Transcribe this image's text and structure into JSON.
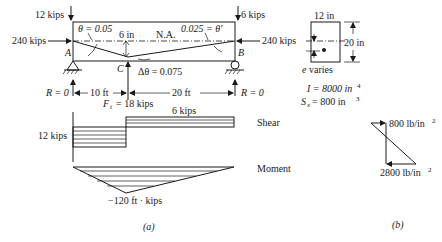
{
  "figure_a": {
    "label": "(a)",
    "beam": {
      "left_support": "A",
      "right_support": "B",
      "point_c": "C",
      "left_vertical_load": "12 kips",
      "right_vertical_load": "6 kips",
      "left_axial_load": "240 kips",
      "right_axial_load": "240 kips",
      "theta_left": "θ = 0.05",
      "theta_right": "0.025 = θ′",
      "eccentricity": "6 in",
      "neutral_axis": "N.A.",
      "delta_theta": "Δθ = 0.075",
      "reaction_left": "R = 0",
      "reaction_right": "R = 0",
      "span_left": "10 ft",
      "span_right": "20 ft",
      "tendon_force": "F",
      "tendon_force_sub": "t",
      "tendon_force_value": "= 18 kips"
    },
    "shear": {
      "title": "Shear",
      "left_value": "12 kips",
      "right_value": "6 kips"
    },
    "moment": {
      "title": "Moment",
      "min_value": "−120 ft · kips"
    }
  },
  "figure_b": {
    "label": "(b)",
    "section": {
      "width": "12 in",
      "height": "20 in",
      "e_label": "e",
      "e_text": "varies"
    },
    "I": "I = 8000 in",
    "I_exp": "4",
    "Sx": "S",
    "Sx_sub": "x",
    "Sx_value": "= 800 in",
    "Sx_exp": "3",
    "stress_top": "800 lb/in",
    "stress_top_exp": "2",
    "stress_bottom": "2800 lb/in",
    "stress_bottom_exp": "2"
  }
}
